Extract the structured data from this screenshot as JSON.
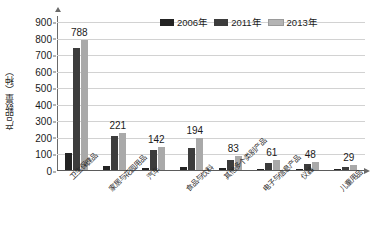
{
  "chart_data": {
    "type": "bar",
    "title": "",
    "xlabel": "",
    "ylabel": "产品数量（种）",
    "ylim": [
      0,
      900
    ],
    "ytick_step": 100,
    "grid": true,
    "legend_position": "top-right",
    "categories": [
      "卫生保健品",
      "家居与花园用品",
      "汽车",
      "食品与饮料",
      "其他多个类别产品",
      "电子与信息产品",
      "仪器",
      "儿童用品"
    ],
    "series": [
      {
        "name": "2006年",
        "values": [
          100,
          25,
          12,
          20,
          10,
          8,
          6,
          4
        ]
      },
      {
        "name": "2011年",
        "values": [
          740,
          205,
          120,
          130,
          60,
          45,
          36,
          20
        ]
      },
      {
        "name": "2013年",
        "values": [
          788,
          221,
          142,
          194,
          83,
          61,
          48,
          29
        ]
      }
    ],
    "value_labels": [
      788,
      221,
      142,
      194,
      83,
      61,
      48,
      29
    ],
    "ytick_labels": [
      "900",
      "800",
      "700",
      "600",
      "500",
      "400",
      "300",
      "200",
      "100",
      "0"
    ],
    "colors": {
      "series_2006": "#232323",
      "series_2011": "#3c3c3c",
      "series_2013": "#a9a9a9",
      "gridline": "#d2d2d2",
      "axis": "#6a6a6a",
      "background": "#ffffff",
      "text": "#1a1a1a"
    }
  },
  "legend": {
    "items": [
      {
        "label": "2006年"
      },
      {
        "label": "2011年"
      },
      {
        "label": "2013年"
      }
    ]
  },
  "axis": {
    "y_title": "产品数量（种）"
  }
}
